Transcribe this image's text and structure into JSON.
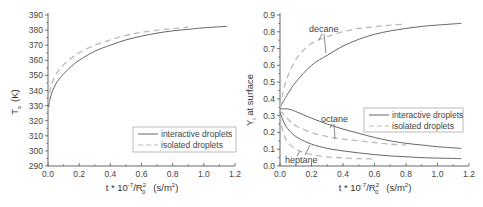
{
  "chart_data": [
    {
      "type": "line",
      "title": "",
      "xlabel": "t * 10^-7/R_0^2  (s/m^2)",
      "ylabel": "T_s  (K)",
      "xlim": [
        0.0,
        1.2
      ],
      "ylim": [
        290,
        390
      ],
      "xticks": [
        "0.0",
        "0.2",
        "0.4",
        "0.6",
        "0.8",
        "1.0",
        "1.2"
      ],
      "yticks": [
        "290",
        "300",
        "310",
        "320",
        "330",
        "340",
        "350",
        "360",
        "370",
        "380",
        "390"
      ],
      "grid": false,
      "legend_position": "lower right",
      "legend": [
        "interactive droplets",
        "isolated droplets"
      ],
      "series": [
        {
          "name": "interactive droplets",
          "style": "solid",
          "x": [
            0.0,
            0.01,
            0.03,
            0.06,
            0.1,
            0.15,
            0.2,
            0.3,
            0.4,
            0.5,
            0.6,
            0.7,
            0.8,
            0.9,
            1.0,
            1.15
          ],
          "y": [
            325,
            333,
            340,
            346,
            351,
            356,
            360,
            366,
            370,
            373.5,
            376,
            378,
            379.5,
            380.5,
            381.5,
            382.5
          ]
        },
        {
          "name": "isolated droplets",
          "style": "dashed",
          "x": [
            0.0,
            0.01,
            0.03,
            0.06,
            0.1,
            0.15,
            0.2,
            0.3,
            0.4,
            0.5,
            0.6,
            0.7,
            0.8,
            0.9
          ],
          "y": [
            325,
            338,
            346,
            352,
            357,
            361.5,
            365,
            370,
            373.5,
            376.5,
            378.5,
            380,
            381,
            382
          ]
        }
      ]
    },
    {
      "type": "line",
      "title": "",
      "xlabel": "t * 10^-7/R_0^2  (s/m^2)",
      "ylabel": "Y_i at surface",
      "xlim": [
        0.0,
        1.2
      ],
      "ylim": [
        0.0,
        0.9
      ],
      "xticks": [
        "0.0",
        "0.2",
        "0.4",
        "0.6",
        "0.8",
        "1.0",
        "1.2"
      ],
      "yticks": [
        "0.0",
        "0.1",
        "0.2",
        "0.3",
        "0.4",
        "0.5",
        "0.6",
        "0.7",
        "0.8",
        "0.9"
      ],
      "grid": false,
      "legend_position": "center right",
      "legend": [
        "interactive droplets",
        "isolated droplets"
      ],
      "annotations": [
        "decane",
        "octane",
        "heptane"
      ],
      "series": [
        {
          "name": "decane - interactive droplets",
          "style": "solid",
          "x": [
            0.0,
            0.05,
            0.1,
            0.2,
            0.3,
            0.4,
            0.5,
            0.6,
            0.7,
            0.8,
            0.9,
            1.0,
            1.15
          ],
          "y": [
            0.35,
            0.43,
            0.5,
            0.6,
            0.66,
            0.715,
            0.755,
            0.785,
            0.805,
            0.82,
            0.832,
            0.84,
            0.85
          ]
        },
        {
          "name": "decane - isolated droplets",
          "style": "dashed",
          "x": [
            0.0,
            0.03,
            0.07,
            0.12,
            0.2,
            0.3,
            0.4,
            0.5,
            0.6,
            0.7,
            0.8
          ],
          "y": [
            0.35,
            0.48,
            0.58,
            0.66,
            0.73,
            0.77,
            0.8,
            0.82,
            0.83,
            0.84,
            0.845
          ]
        },
        {
          "name": "octane - interactive droplets",
          "style": "solid",
          "x": [
            0.0,
            0.05,
            0.1,
            0.2,
            0.3,
            0.4,
            0.5,
            0.6,
            0.7,
            0.8,
            0.9,
            1.0,
            1.15
          ],
          "y": [
            0.34,
            0.34,
            0.325,
            0.285,
            0.25,
            0.22,
            0.195,
            0.17,
            0.15,
            0.135,
            0.125,
            0.115,
            0.105
          ]
        },
        {
          "name": "octane - isolated droplets",
          "style": "dashed",
          "x": [
            0.0,
            0.05,
            0.1,
            0.2,
            0.3,
            0.4,
            0.5,
            0.6,
            0.7,
            0.8
          ],
          "y": [
            0.33,
            0.28,
            0.24,
            0.2,
            0.175,
            0.16,
            0.15,
            0.14,
            0.13,
            0.125
          ]
        },
        {
          "name": "heptane - interactive droplets",
          "style": "solid",
          "x": [
            0.0,
            0.03,
            0.07,
            0.12,
            0.2,
            0.3,
            0.4,
            0.5,
            0.6,
            0.7,
            0.8,
            0.9,
            1.0,
            1.15
          ],
          "y": [
            0.32,
            0.25,
            0.2,
            0.165,
            0.13,
            0.105,
            0.09,
            0.078,
            0.068,
            0.06,
            0.055,
            0.05,
            0.047,
            0.044
          ]
        },
        {
          "name": "heptane - isolated droplets",
          "style": "dashed",
          "x": [
            0.0,
            0.02,
            0.05,
            0.1,
            0.15,
            0.2,
            0.3,
            0.4,
            0.5,
            0.6
          ],
          "y": [
            0.3,
            0.2,
            0.14,
            0.1,
            0.08,
            0.068,
            0.055,
            0.048,
            0.044,
            0.042
          ]
        }
      ]
    }
  ],
  "left_chart": {
    "ylabel_main": "T",
    "ylabel_sub": "s",
    "ylabel_unit": "(K)",
    "xlabel_pre": "t * 10",
    "xlabel_exp": "-7",
    "xlabel_mid": "/R",
    "xlabel_sup": "2",
    "xlabel_sub": "0",
    "xlabel_unit": "(s/m",
    "xlabel_unit_sup": "2",
    "xlabel_unit_close": ")",
    "legend_interactive": "interactive droplets",
    "legend_isolated": "isolated droplets"
  },
  "right_chart": {
    "ylabel_main": "Y",
    "ylabel_sub": "i",
    "ylabel_rest": " at surface",
    "xlabel_pre": "t * 10",
    "xlabel_exp": "-7",
    "xlabel_mid": "/R",
    "xlabel_sup": "2",
    "xlabel_sub": "0",
    "xlabel_unit": "(s/m",
    "xlabel_unit_sup": "2",
    "xlabel_unit_close": ")",
    "legend_interactive": "interactive droplets",
    "legend_isolated": "isolated droplets",
    "annot_decane": "decane",
    "annot_octane": "octane",
    "annot_heptane": "heptane"
  },
  "colors": {
    "axis": "#555555",
    "solid_line": "#666666",
    "dashed_line": "#bbbbbb"
  }
}
